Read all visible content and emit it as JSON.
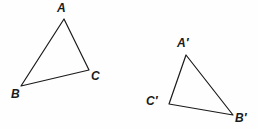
{
  "figure": {
    "background_color": "#fefefe",
    "stroke_color": "#1a1a1a",
    "stroke_width": 1.2,
    "label_color": "#1a1a1a"
  },
  "shapes": [
    {
      "name": "triangle-abc",
      "vertices": [
        {
          "label": "A",
          "x": 64,
          "y": 19,
          "label_x": 57,
          "label_y": 2
        },
        {
          "label": "B",
          "x": 21,
          "y": 86,
          "label_x": 11,
          "label_y": 88
        },
        {
          "label": "C",
          "x": 89,
          "y": 70,
          "label_x": 91,
          "label_y": 70
        }
      ],
      "points": "64,19 21,86 89,70"
    },
    {
      "name": "triangle-abc-prime",
      "vertices": [
        {
          "label": "A′",
          "x": 186,
          "y": 55,
          "label_x": 177,
          "label_y": 37
        },
        {
          "label": "C′",
          "x": 169,
          "y": 104,
          "label_x": 146,
          "label_y": 95
        },
        {
          "label": "B′",
          "x": 233,
          "y": 115,
          "label_x": 235,
          "label_y": 112
        }
      ],
      "points": "186,55 169,104 233,115"
    }
  ]
}
